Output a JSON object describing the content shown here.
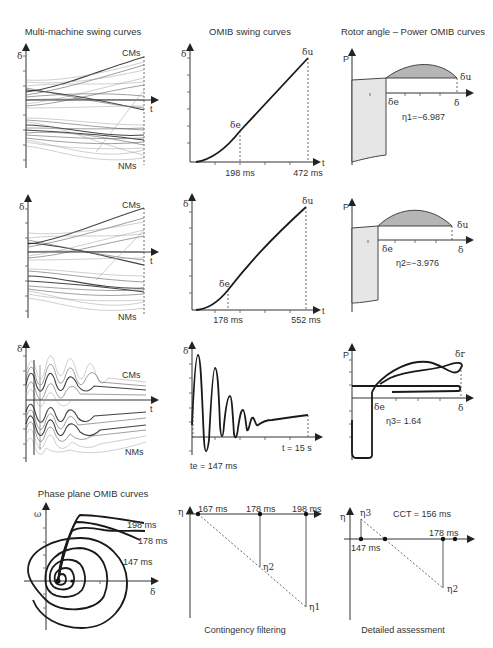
{
  "columns": {
    "col1_title": "Multi-machine swing curves",
    "col2_title": "OMIB swing curves",
    "col3_title": "Rotor angle – Power OMIB curves"
  },
  "row1": {
    "mm": {
      "y_axis": "δ",
      "x_axis": "t",
      "cms": "CMs",
      "nms": "NMs"
    },
    "omib": {
      "y_axis": "δ",
      "x_axis": "t",
      "delta_e": "δe",
      "delta_u": "δu",
      "t1": "198 ms",
      "t2": "472 ms"
    },
    "pa": {
      "y_axis": "P",
      "x_axis": "δ",
      "delta_e": "δe",
      "delta_u": "δu",
      "eta": "η1=−6.987"
    }
  },
  "row2": {
    "mm": {
      "y_axis": "δ",
      "x_axis": "t",
      "cms": "CMs",
      "nms": "NMs"
    },
    "omib": {
      "y_axis": "δ",
      "x_axis": "t",
      "delta_e": "δe",
      "delta_u": "δu",
      "t1": "178 ms",
      "t2": "552 ms"
    },
    "pa": {
      "y_axis": "P",
      "x_axis": "δ",
      "delta_e": "δe",
      "delta_u": "δu",
      "eta": "η2=−3.976"
    }
  },
  "row3": {
    "mm": {
      "y_axis": "δ",
      "x_axis": "t",
      "cms": "CMs",
      "nms": "NMs"
    },
    "omib": {
      "y_axis": "δ",
      "te": "te = 147 ms",
      "tend": "t = 15 s"
    },
    "pa": {
      "y_axis": "P",
      "x_axis": "δ",
      "delta_e": "δe",
      "delta_r": "δr",
      "eta": "η3= 1.64"
    }
  },
  "row4": {
    "phase": {
      "title": "Phase plane OMIB curves",
      "y_axis": "ω",
      "x_axis": "δ",
      "labels": [
        "198 ms",
        "178 ms",
        "147 ms"
      ]
    },
    "filter": {
      "y_axis": "η",
      "points": [
        "167 ms",
        "178 ms",
        "198 ms"
      ],
      "eta2": "η2",
      "eta1": "η1",
      "caption": "Contingency filtering"
    },
    "detail": {
      "y_axis": "η",
      "eta3": "η3",
      "eta2": "η2",
      "t147": "147 ms",
      "t178": "178 ms",
      "cct": "CCT = 156 ms",
      "caption": "Detailed assessment"
    }
  }
}
